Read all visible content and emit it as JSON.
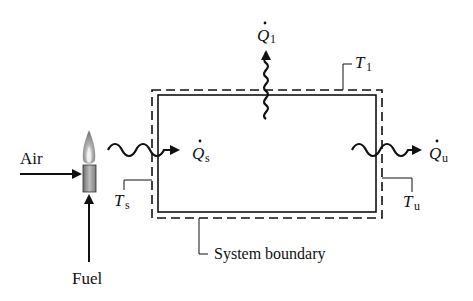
{
  "diagram": {
    "labels": {
      "air": "Air",
      "fuel": "Fuel",
      "q1_symbol": "Q",
      "q1_sub": "1",
      "qs_symbol": "Q",
      "qs_sub": "s",
      "qu_symbol": "Q",
      "qu_sub": "u",
      "t1_symbol": "T",
      "t1_sub": "1",
      "ts_symbol": "T",
      "ts_sub": "s",
      "tu_symbol": "T",
      "tu_sub": "u",
      "system_boundary": "System boundary"
    },
    "colors": {
      "line": "#111111",
      "flame_outer": "#8a8a8a",
      "flame_inner": "#d8d8d8",
      "burner": "#9a9a9a"
    }
  }
}
